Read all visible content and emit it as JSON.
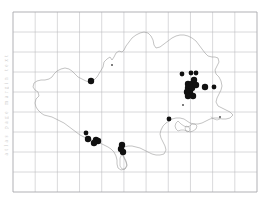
{
  "figure": {
    "kind": "distribution-map",
    "region_name": "Dorset",
    "margin_note": "atlas page margin text",
    "grid": {
      "visible": true,
      "columns": 11,
      "rows": 9,
      "cell_px": 22.2,
      "left": 13,
      "top": 12,
      "right": 257,
      "bottom": 192,
      "line_color": "#b9b9bd",
      "border_color": "#a8a8ad"
    },
    "coastline": {
      "stroke_color": "#9a9a9a",
      "stroke_width": 0.6,
      "fill": "none"
    },
    "marker_style": {
      "shape": "filled-circle",
      "color": "#111111",
      "large_radius_px": 3.2,
      "medium_radius_px": 2.4,
      "small_radius_px": 1.0
    }
  },
  "chart_data": {
    "type": "scatter",
    "title": "",
    "subtitle": "",
    "xlabel": "",
    "ylabel": "",
    "grid": true,
    "legend_position": "none",
    "xlim": [
      13,
      257
    ],
    "ylim": [
      192,
      12
    ],
    "series": [
      {
        "name": "records (large)",
        "marker": "filled-circle",
        "size": "large",
        "color": "#111111",
        "points": [
          [
            91,
            81
          ],
          [
            188,
            84
          ],
          [
            188,
            88
          ],
          [
            192,
            84
          ],
          [
            192,
            88
          ],
          [
            194,
            80
          ],
          [
            196,
            85
          ],
          [
            190,
            92
          ],
          [
            187,
            92
          ],
          [
            193,
            96
          ],
          [
            188,
            96
          ],
          [
            205,
            87
          ],
          [
            88,
            139
          ],
          [
            96,
            140
          ],
          [
            98,
            141
          ],
          [
            94,
            143
          ],
          [
            122,
            145
          ],
          [
            123,
            152
          ],
          [
            121,
            149
          ]
        ]
      },
      {
        "name": "records (medium)",
        "marker": "filled-circle",
        "size": "medium",
        "color": "#111111",
        "points": [
          [
            182,
            74
          ],
          [
            191,
            73
          ],
          [
            196,
            73
          ],
          [
            214,
            87
          ],
          [
            169,
            119
          ],
          [
            86,
            133
          ]
        ]
      },
      {
        "name": "records (small / faint)",
        "marker": "filled-circle",
        "size": "small",
        "color": "#555555",
        "points": [
          [
            112,
            65
          ],
          [
            183,
            105
          ],
          [
            220,
            117
          ]
        ]
      }
    ]
  }
}
